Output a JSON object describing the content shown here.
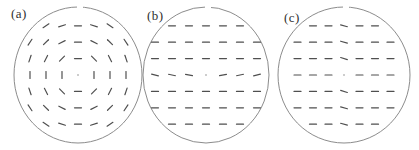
{
  "figure": {
    "background": "#ffffff",
    "outline_color": "#8c8c8c",
    "dash_color": "#4f4f4f",
    "dash_length": 7,
    "dash_width": 1.2,
    "core_color": "#bdbdbd",
    "label_color": "#2f2f2f",
    "panels": [
      {
        "id": "a",
        "label": "(a)",
        "field_type": "tangential-concentric",
        "cx": 78,
        "cy": 75,
        "rx": 64,
        "ry": 68,
        "grid": {
          "sx": 16,
          "sy": 16.4
        },
        "label_pos": {
          "x": 11,
          "y": 7
        },
        "core": true,
        "dashes": [
          [
            -2,
            -3,
            -33.7
          ],
          [
            -1,
            -3,
            -18.4
          ],
          [
            0,
            -3,
            0
          ],
          [
            1,
            -3,
            18.4
          ],
          [
            2,
            -3,
            33.7
          ],
          [
            -3,
            -2,
            -56.3
          ],
          [
            -2,
            -2,
            -45
          ],
          [
            -1,
            -2,
            -26.6
          ],
          [
            0,
            -2,
            0
          ],
          [
            1,
            -2,
            26.6
          ],
          [
            2,
            -2,
            45
          ],
          [
            3,
            -2,
            56.3
          ],
          [
            -3,
            -1,
            -71.6
          ],
          [
            -2,
            -1,
            -63.4
          ],
          [
            -1,
            -1,
            -45
          ],
          [
            0,
            -1,
            0
          ],
          [
            1,
            -1,
            45
          ],
          [
            2,
            -1,
            63.4
          ],
          [
            3,
            -1,
            71.6
          ],
          [
            -3,
            0,
            90
          ],
          [
            -2,
            0,
            90
          ],
          [
            -1,
            0,
            90
          ],
          [
            1,
            0,
            90
          ],
          [
            2,
            0,
            90
          ],
          [
            3,
            0,
            90
          ],
          [
            -3,
            1,
            71.6
          ],
          [
            -2,
            1,
            63.4
          ],
          [
            -1,
            1,
            45
          ],
          [
            0,
            1,
            0
          ],
          [
            1,
            1,
            -45
          ],
          [
            2,
            1,
            -63.4
          ],
          [
            3,
            1,
            -71.6
          ],
          [
            -3,
            2,
            56.3
          ],
          [
            -2,
            2,
            45
          ],
          [
            -1,
            2,
            26.6
          ],
          [
            0,
            2,
            0
          ],
          [
            1,
            2,
            -26.6
          ],
          [
            2,
            2,
            -45
          ],
          [
            3,
            2,
            -56.3
          ],
          [
            -2,
            3,
            33.7
          ],
          [
            -1,
            3,
            18.4
          ],
          [
            0,
            3,
            0
          ],
          [
            1,
            3,
            -18.4
          ],
          [
            2,
            3,
            -33.7
          ]
        ]
      },
      {
        "id": "b",
        "label": "(b)",
        "field_type": "uniform-horizontal-splay-row",
        "cx": 206,
        "cy": 75,
        "rx": 63,
        "ry": 68,
        "grid": {
          "sx": 17,
          "sy": 16.4
        },
        "label_pos": {
          "x": 147,
          "y": 9
        },
        "core": true,
        "dashes": [
          [
            -2,
            -3,
            0
          ],
          [
            -1,
            -3,
            0
          ],
          [
            0,
            -3,
            0
          ],
          [
            1,
            -3,
            0
          ],
          [
            2,
            -3,
            0
          ],
          [
            -3,
            -2,
            0
          ],
          [
            -2,
            -2,
            0
          ],
          [
            -1,
            -2,
            0
          ],
          [
            0,
            -2,
            0
          ],
          [
            1,
            -2,
            0
          ],
          [
            2,
            -2,
            0
          ],
          [
            3,
            -2,
            0
          ],
          [
            -3,
            -1,
            0
          ],
          [
            -2,
            -1,
            0
          ],
          [
            -1,
            -1,
            0
          ],
          [
            0,
            -1,
            0
          ],
          [
            1,
            -1,
            0
          ],
          [
            2,
            -1,
            0
          ],
          [
            3,
            -1,
            0
          ],
          [
            -3,
            0,
            14
          ],
          [
            -2,
            0,
            12
          ],
          [
            -1,
            0,
            9
          ],
          [
            1,
            0,
            -9
          ],
          [
            2,
            0,
            -12
          ],
          [
            3,
            0,
            -14
          ],
          [
            -3,
            1,
            0
          ],
          [
            -2,
            1,
            0
          ],
          [
            -1,
            1,
            0
          ],
          [
            0,
            1,
            0
          ],
          [
            1,
            1,
            0
          ],
          [
            2,
            1,
            0
          ],
          [
            3,
            1,
            0
          ],
          [
            -3,
            2,
            0
          ],
          [
            -2,
            2,
            0
          ],
          [
            -1,
            2,
            0
          ],
          [
            0,
            2,
            0
          ],
          [
            1,
            2,
            0
          ],
          [
            2,
            2,
            0
          ],
          [
            3,
            2,
            0
          ],
          [
            -2,
            3,
            0
          ],
          [
            -1,
            3,
            0
          ],
          [
            0,
            3,
            0
          ],
          [
            1,
            3,
            0
          ],
          [
            2,
            3,
            0
          ]
        ]
      },
      {
        "id": "c",
        "label": "(c)",
        "field_type": "uniform-horizontal-tilted-center-column",
        "cx": 344,
        "cy": 75,
        "rx": 66,
        "ry": 68,
        "grid": {
          "sx": 15.5,
          "sy": 16.4
        },
        "label_pos": {
          "x": 284,
          "y": 11
        },
        "core": true,
        "dashes": [
          [
            -2,
            -3,
            0
          ],
          [
            -1,
            -3,
            0
          ],
          [
            0,
            -3,
            15
          ],
          [
            1,
            -3,
            0
          ],
          [
            2,
            -3,
            0
          ],
          [
            -3,
            -2,
            0
          ],
          [
            -2,
            -2,
            0
          ],
          [
            -1,
            -2,
            0
          ],
          [
            0,
            -2,
            16
          ],
          [
            1,
            -2,
            0
          ],
          [
            2,
            -2,
            0
          ],
          [
            3,
            -2,
            0
          ],
          [
            -3,
            -1,
            0
          ],
          [
            -2,
            -1,
            0
          ],
          [
            -1,
            -1,
            0
          ],
          [
            0,
            -1,
            18
          ],
          [
            1,
            -1,
            0
          ],
          [
            2,
            -1,
            0
          ],
          [
            3,
            -1,
            0
          ],
          [
            -3,
            0,
            0
          ],
          [
            -2,
            0,
            0
          ],
          [
            -1,
            0,
            0
          ],
          [
            1,
            0,
            0
          ],
          [
            2,
            0,
            0
          ],
          [
            3,
            0,
            0
          ],
          [
            -3,
            1,
            0
          ],
          [
            -2,
            1,
            0
          ],
          [
            -1,
            1,
            0
          ],
          [
            0,
            1,
            18
          ],
          [
            1,
            1,
            0
          ],
          [
            2,
            1,
            0
          ],
          [
            3,
            1,
            0
          ],
          [
            -3,
            2,
            0
          ],
          [
            -2,
            2,
            0
          ],
          [
            -1,
            2,
            0
          ],
          [
            0,
            2,
            16
          ],
          [
            1,
            2,
            0
          ],
          [
            2,
            2,
            0
          ],
          [
            3,
            2,
            0
          ],
          [
            -2,
            3,
            0
          ],
          [
            -1,
            3,
            0
          ],
          [
            0,
            3,
            15
          ],
          [
            1,
            3,
            0
          ],
          [
            2,
            3,
            0
          ]
        ]
      }
    ]
  }
}
